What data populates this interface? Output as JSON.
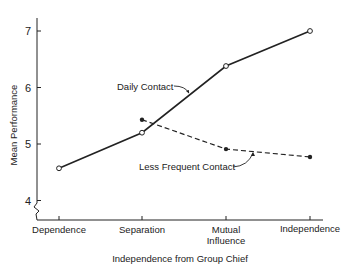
{
  "chart_data": {
    "type": "line",
    "title": "",
    "xlabel": "Independence from Group Chief",
    "ylabel": "Mean Performance",
    "categories": [
      "Dependence",
      "Separation",
      "Mutual Influence",
      "Independence"
    ],
    "category_lines": [
      [
        "Dependence"
      ],
      [
        "Separation"
      ],
      [
        "Mutual",
        "Influence"
      ],
      [
        "Independence"
      ]
    ],
    "yticks": [
      4,
      5,
      6,
      7
    ],
    "ylim": [
      3.7,
      7.2
    ],
    "axis_break": true,
    "grid": false,
    "series": [
      {
        "name": "Daily Contact",
        "style": "solid",
        "marker": "open-circle",
        "values": [
          4.57,
          5.2,
          6.38,
          7.0
        ]
      },
      {
        "name": "Less Frequent Contact",
        "style": "dashed",
        "marker": "filled-circle",
        "values": [
          null,
          5.43,
          4.91,
          4.77
        ]
      }
    ],
    "annotations": [
      {
        "text": "Daily Contact",
        "points_to": "Daily Contact"
      },
      {
        "text": "Less Frequent Contact",
        "points_to": "Less Frequent Contact"
      }
    ]
  },
  "colors": {
    "ink": "#222222",
    "background": "#ffffff"
  }
}
